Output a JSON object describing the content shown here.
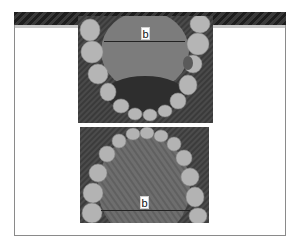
{
  "figure": {
    "panels": [
      {
        "id": "mandibular-arch",
        "description": "occlusal view of lower dental arch",
        "label": "b"
      },
      {
        "id": "maxillary-arch",
        "description": "occlusal view of upper dental arch",
        "label": "b"
      }
    ]
  }
}
